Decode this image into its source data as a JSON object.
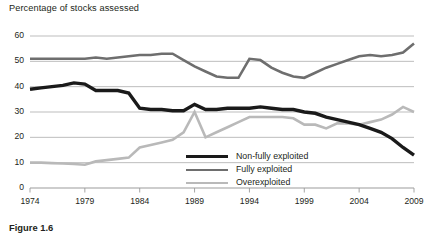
{
  "chart_title": "Percentage of stocks assessed",
  "caption": "Figure 1.6",
  "axis": {
    "y_ticks": [
      "0",
      "10",
      "20",
      "30",
      "40",
      "50",
      "60"
    ],
    "x_ticks": [
      "1974",
      "1979",
      "1984",
      "1989",
      "1994",
      "1999",
      "2004",
      "2009"
    ]
  },
  "legend": {
    "items": [
      {
        "label": "Non-fully exploited",
        "color": "#1a1a1a"
      },
      {
        "label": "Fully exploited",
        "color": "#6e6e6e"
      },
      {
        "label": "Overexploited",
        "color": "#b9b9b9"
      }
    ]
  },
  "chart_data": {
    "type": "line",
    "title": "Percentage of stocks assessed",
    "xlabel": "",
    "ylabel": "Percentage of stocks assessed",
    "xlim": [
      1974,
      2009
    ],
    "ylim": [
      0,
      60
    ],
    "grid": true,
    "legend_position": "inside-bottom-right",
    "x": [
      1974,
      1975,
      1976,
      1977,
      1978,
      1979,
      1980,
      1981,
      1982,
      1983,
      1984,
      1985,
      1986,
      1987,
      1988,
      1989,
      1990,
      1991,
      1992,
      1993,
      1994,
      1995,
      1996,
      1997,
      1998,
      1999,
      2000,
      2001,
      2002,
      2003,
      2004,
      2005,
      2006,
      2007,
      2008,
      2009
    ],
    "series": [
      {
        "name": "Non-fully exploited",
        "color": "#1a1a1a",
        "values": [
          39.0,
          39.5,
          40.0,
          40.5,
          41.5,
          41.0,
          38.5,
          38.5,
          38.5,
          37.5,
          31.5,
          31.0,
          31.0,
          30.5,
          30.5,
          33.0,
          31.0,
          31.0,
          31.5,
          31.5,
          31.5,
          32.0,
          31.5,
          31.0,
          31.0,
          30.0,
          29.5,
          28.0,
          27.0,
          26.0,
          25.0,
          23.5,
          22.0,
          19.5,
          16.0,
          13.0
        ]
      },
      {
        "name": "Fully exploited",
        "color": "#6e6e6e",
        "values": [
          51.0,
          51.0,
          51.0,
          51.0,
          51.0,
          51.0,
          51.5,
          51.0,
          51.5,
          52.0,
          52.5,
          52.5,
          53.0,
          53.0,
          50.5,
          48.0,
          46.0,
          44.0,
          43.5,
          43.5,
          51.0,
          50.5,
          47.5,
          45.5,
          44.0,
          43.5,
          45.5,
          47.5,
          49.0,
          50.5,
          52.0,
          52.5,
          52.0,
          52.5,
          53.5,
          57.0
        ]
      },
      {
        "name": "Overexploited",
        "color": "#b9b9b9",
        "values": [
          10.0,
          10.0,
          9.8,
          9.7,
          9.5,
          9.2,
          10.5,
          11.0,
          11.5,
          12.0,
          16.0,
          17.0,
          18.0,
          19.0,
          22.0,
          30.0,
          20.0,
          22.0,
          24.0,
          26.0,
          28.0,
          28.0,
          28.0,
          28.0,
          27.5,
          25.0,
          25.0,
          23.5,
          25.5,
          25.5,
          25.0,
          26.0,
          27.0,
          29.0,
          32.0,
          30.0
        ]
      }
    ]
  }
}
